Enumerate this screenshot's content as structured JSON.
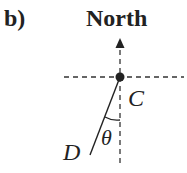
{
  "panel_label": "b)",
  "direction_label": "North",
  "points": {
    "center": "C",
    "end": "D"
  },
  "angle_label": "θ",
  "colors": {
    "ink": "#222222",
    "background": "#ffffff"
  }
}
